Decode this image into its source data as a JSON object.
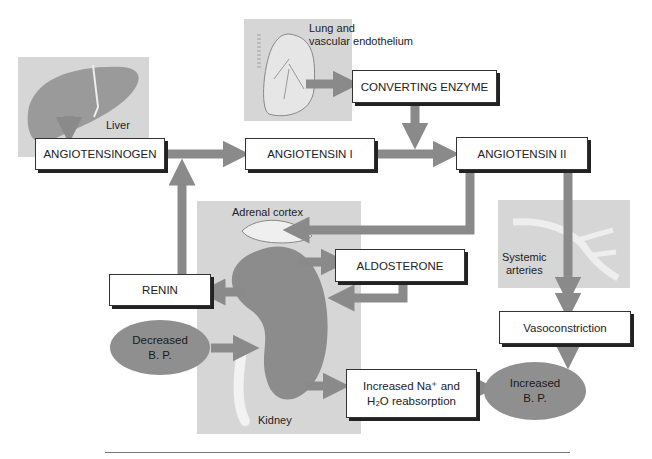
{
  "diagram": {
    "colors": {
      "panel": "#d6d6d6",
      "arrow": "#8a8a8a",
      "oval": "#8f8f8f",
      "box_border": "#333333"
    },
    "organs": {
      "liver": "Liver",
      "lung_line1": "Lung and",
      "lung_line2": "vascular endothelium",
      "adrenal": "Adrenal cortex",
      "kidney": "Kidney",
      "arteries_line1": "Systemic",
      "arteries_line2": "arteries"
    },
    "boxes": {
      "angiotensinogen": "ANGIOTENSINOGEN",
      "angiotensin1": "ANGIOTENSIN I",
      "angiotensin2": "ANGIOTENSIN II",
      "converting_enzyme": "CONVERTING ENZYME",
      "aldosterone": "ALDOSTERONE",
      "renin": "RENIN",
      "vasoconstriction": "Vasoconstriction",
      "reabsorption_line1": "Increased Na⁺ and",
      "reabsorption_line2": "H₂O reabsorption"
    },
    "ovals": {
      "decreased_line1": "Decreased",
      "decreased_line2": "B. P.",
      "increased_line1": "Increased",
      "increased_line2": "B. P."
    }
  }
}
